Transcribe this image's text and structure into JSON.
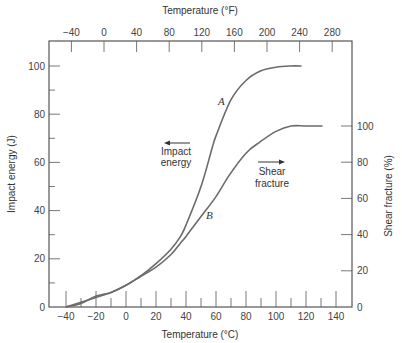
{
  "chart_data": {
    "type": "line",
    "title": "",
    "xlabel": "Temperature (°C)",
    "x2label": "Temperature (°F)",
    "ylabel": "Impact energy (J)",
    "y2label": "Shear fracture (%)",
    "xlim": [
      -50,
      150
    ],
    "ylim": [
      0,
      110
    ],
    "y2lim": [
      0,
      100
    ],
    "x_ticks": [
      -40,
      -20,
      0,
      20,
      40,
      60,
      80,
      100,
      120,
      140
    ],
    "x2_ticks": [
      -40,
      0,
      40,
      80,
      120,
      160,
      200,
      240,
      280
    ],
    "y_ticks": [
      0,
      20,
      40,
      60,
      80,
      100
    ],
    "y2_ticks": [
      0,
      20,
      40,
      60,
      80,
      100
    ],
    "grid": false,
    "series": [
      {
        "name": "A",
        "label": "Impact energy",
        "axis": "left",
        "x": [
          -40,
          -30,
          -20,
          -10,
          0,
          10,
          20,
          30,
          36,
          40,
          50,
          57,
          60,
          70,
          80,
          90,
          100,
          110,
          117
        ],
        "y": [
          0,
          2,
          4,
          6,
          9,
          13,
          18,
          24,
          29,
          34,
          50,
          65,
          71,
          86,
          94,
          98,
          99.5,
          100,
          100
        ]
      },
      {
        "name": "B",
        "label": "Shear fracture",
        "axis": "right",
        "x": [
          -40,
          -30,
          -20,
          -10,
          0,
          10,
          20,
          30,
          36,
          40,
          50,
          60,
          69,
          80,
          89,
          100,
          110,
          120,
          131
        ],
        "y": [
          0,
          2,
          6,
          8,
          12,
          17,
          22,
          29,
          35,
          39,
          50,
          61,
          73,
          85,
          91,
          97,
          100,
          100,
          100
        ]
      }
    ],
    "annotations": [
      {
        "text": "A",
        "near_series": "A"
      },
      {
        "text": "B",
        "near_series": "B"
      },
      {
        "text": "Impact energy",
        "arrow": "left"
      },
      {
        "text": "Shear fracture",
        "arrow": "right"
      }
    ]
  },
  "labels": {
    "x_title": "Temperature (°C)",
    "x2_title": "Temperature (°F)",
    "y_title": "Impact energy (J)",
    "y2_title": "Shear fracture (%)",
    "curve_a": "A",
    "curve_b": "B",
    "impact_line1": "Impact",
    "impact_line2": "energy",
    "shear_line1": "Shear",
    "shear_line2": "fracture"
  },
  "colors": {
    "curve": "#6b6b6b",
    "axis": "#555555"
  }
}
